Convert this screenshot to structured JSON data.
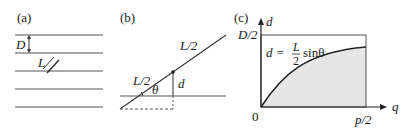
{
  "panels": {
    "a": {
      "label": "(a)",
      "spacing_label": "D",
      "needle_label": "L"
    },
    "b": {
      "label": "(b)",
      "half_length_upper": "L/2",
      "half_length_lower": "L/2",
      "angle_label": "θ",
      "distance_label": "d"
    },
    "c": {
      "label": "(c)",
      "y_axis_label": "d",
      "x_axis_label": "q",
      "y_max_label": "D/2",
      "x_max_label": "p/2",
      "origin_label": "0",
      "formula_lhs": "d =",
      "formula_num": "L",
      "formula_den": "2",
      "formula_rhs": "sinθ"
    }
  },
  "colors": {
    "line": "#555555",
    "shade": "#e6e6e6",
    "curve": "#222222"
  }
}
